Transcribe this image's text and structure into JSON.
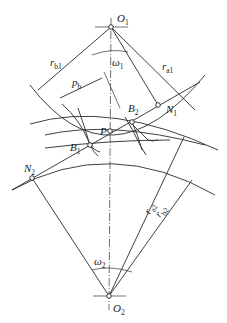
{
  "diagram": {
    "labels": {
      "O1": {
        "main": "O",
        "sub": "1"
      },
      "O2": {
        "main": "O",
        "sub": "2"
      },
      "omega1": {
        "main": "ω",
        "sub": "1"
      },
      "omega2": {
        "main": "ω",
        "sub": "2"
      },
      "rb1": {
        "main": "r",
        "sub": "b1"
      },
      "ra1": {
        "main": "r",
        "sub": "a1"
      },
      "ra2": {
        "main": "r",
        "sub": "a2"
      },
      "rb2": {
        "main": "r",
        "sub": "b2"
      },
      "pb": {
        "main": "p",
        "sub": "b"
      },
      "P": {
        "main": "P",
        "sub": ""
      },
      "B1": {
        "main": "B",
        "sub": "1"
      },
      "B2": {
        "main": "B",
        "sub": "2"
      },
      "N1": {
        "main": "N",
        "sub": "1"
      },
      "N2": {
        "main": "N",
        "sub": "2"
      }
    },
    "points": {
      "O1": [
        111,
        27
      ],
      "O2": [
        109,
        296
      ],
      "P": [
        110,
        131
      ],
      "B1": [
        90,
        145
      ],
      "B2": [
        132,
        122
      ],
      "N1": [
        158,
        105
      ],
      "N2": [
        32,
        178
      ]
    }
  }
}
